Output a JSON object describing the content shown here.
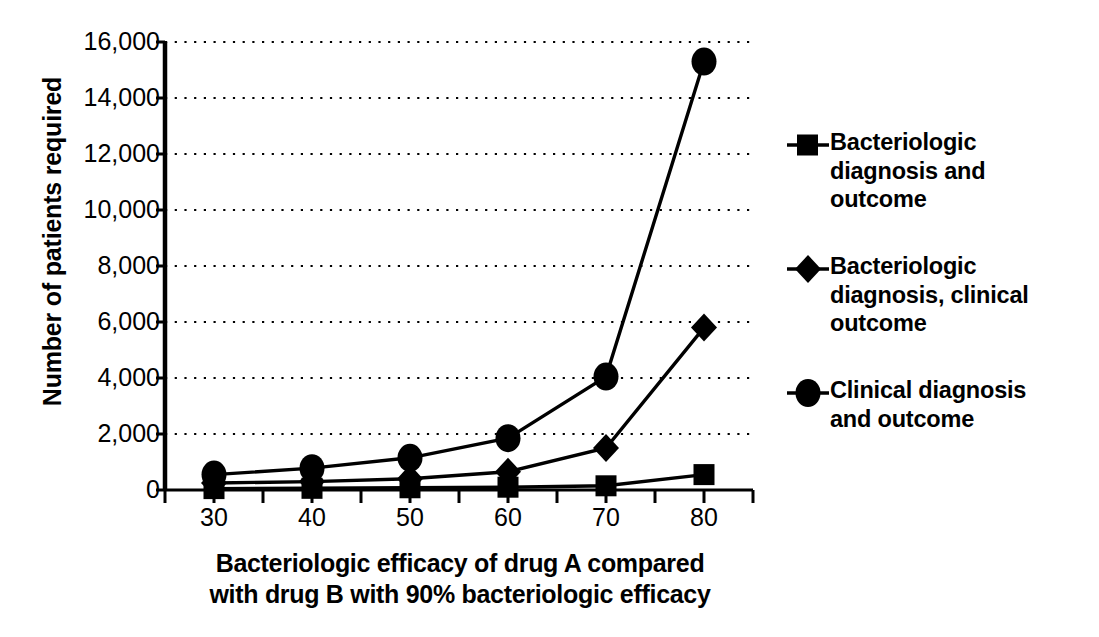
{
  "chart_data": {
    "type": "line",
    "title": "",
    "xlabel": "Bacteriologic efficacy of drug A compared with drug B with 90% bacteriologic efficacy",
    "xlabel_line1": "Bacteriologic efficacy of drug A compared",
    "xlabel_line2": "with drug B with 90% bacteriologic efficacy",
    "ylabel": "Number of patients required",
    "x": [
      30,
      40,
      50,
      60,
      70,
      80
    ],
    "xtick_labels": [
      "30",
      "40",
      "50",
      "60",
      "70",
      "80"
    ],
    "ytick_labels": [
      "0",
      "2,000",
      "4,000",
      "6,000",
      "8,000",
      "10,000",
      "12,000",
      "14,000",
      "16,000"
    ],
    "ytick_values": [
      0,
      2000,
      4000,
      6000,
      8000,
      10000,
      12000,
      14000,
      16000
    ],
    "xlim": [
      25,
      85
    ],
    "ylim": [
      0,
      16000
    ],
    "grid": "horizontal-dotted",
    "legend_position": "right",
    "series": [
      {
        "name": "Bacteriologic diagnosis and outcome",
        "name_lines": [
          "Bacteriologic",
          "diagnosis and",
          "outcome"
        ],
        "marker": "square",
        "color": "#000000",
        "values": [
          50,
          60,
          80,
          100,
          150,
          550
        ]
      },
      {
        "name": "Bacteriologic diagnosis, clinical outcome",
        "name_lines": [
          "Bacteriologic",
          "diagnosis, clinical",
          "outcome"
        ],
        "marker": "diamond",
        "color": "#000000",
        "values": [
          250,
          300,
          400,
          650,
          1500,
          5800
        ]
      },
      {
        "name": "Clinical diagnosis and outcome",
        "name_lines": [
          "Clinical diagnosis",
          "and outcome"
        ],
        "marker": "circle",
        "color": "#000000",
        "values": [
          550,
          780,
          1150,
          1850,
          4050,
          15300
        ]
      }
    ]
  }
}
